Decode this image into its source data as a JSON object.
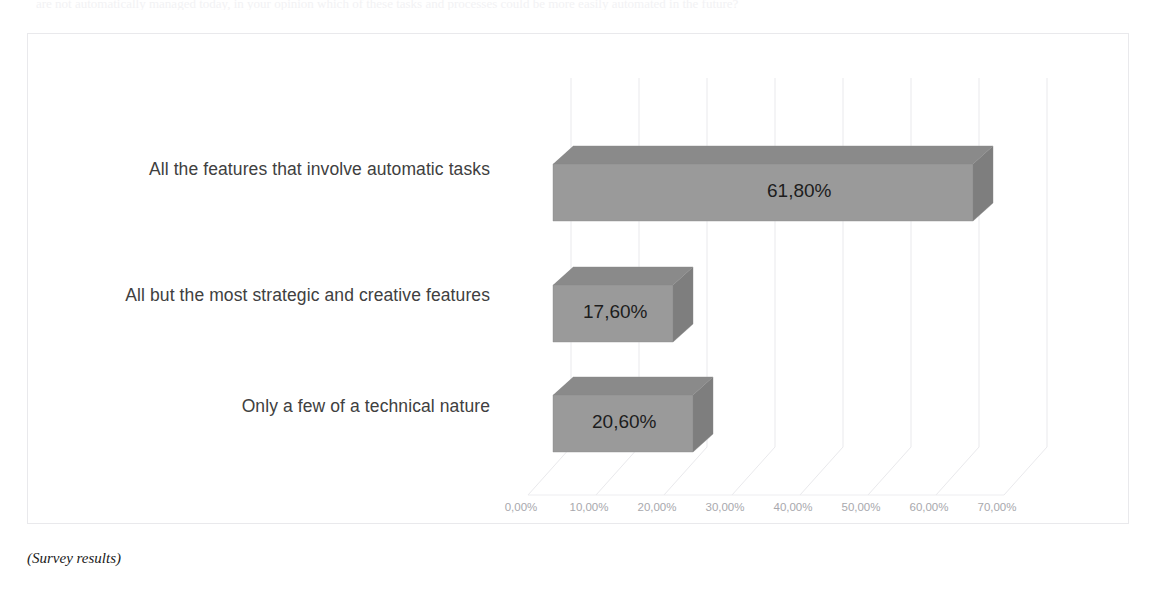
{
  "top_clipped_text": "are not automatically managed today, in your opinion which of these tasks and processes could be more easily automated in the future?",
  "caption": "(Survey results)",
  "chart_data": {
    "type": "bar",
    "orientation": "horizontal",
    "style": "3d-bar",
    "title": "",
    "subtitle": "",
    "xlabel": "",
    "ylabel": "",
    "categories": [
      "All the features that involve automatic tasks",
      "All but the most strategic and creative features",
      "Only a few of a technical nature"
    ],
    "values": [
      61.8,
      17.6,
      20.6
    ],
    "value_labels": [
      "61,80%",
      "17,60%",
      "20,60%"
    ],
    "xlim": [
      0,
      70
    ],
    "x_tick_values": [
      0,
      10,
      20,
      30,
      40,
      50,
      60,
      70
    ],
    "x_tick_labels": [
      "0,00%",
      "10,00%",
      "20,00%",
      "30,00%",
      "40,00%",
      "50,00%",
      "60,00%",
      "70,00%"
    ],
    "grid": true,
    "legend": "none",
    "bar_color": "#9a9a9a",
    "bar_top_color": "#8a8a8a",
    "bar_side_color": "#7e7e7e",
    "grid_color": "#e9e9ec",
    "tick_label_color": "#a8a8ad",
    "category_label_color": "#404040",
    "value_label_color": "#1d1d1d",
    "plot_background": "#ffffff",
    "frame_color": "#e9e9ec"
  },
  "axis": {
    "tick_0": "0,00%",
    "tick_1": "10,00%",
    "tick_2": "20,00%",
    "tick_3": "30,00%",
    "tick_4": "40,00%",
    "tick_5": "50,00%",
    "tick_6": "60,00%",
    "tick_7": "70,00%"
  },
  "bars": [
    {
      "label": "All the features that involve automatic tasks",
      "value_label": "61,80%"
    },
    {
      "label": "All but the most strategic and creative features",
      "value_label": "17,60%"
    },
    {
      "label": "Only a few of a technical nature",
      "value_label": "20,60%"
    }
  ]
}
